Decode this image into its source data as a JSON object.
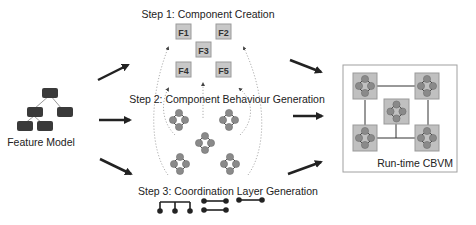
{
  "feature_model": {
    "label": "Feature Model"
  },
  "steps": [
    {
      "label": "Step 1: Component Creation"
    },
    {
      "label": "Step 2: Component Behaviour Generation"
    },
    {
      "label": "Step 3: Coordination Layer Generation"
    }
  ],
  "components": [
    {
      "id": "F1"
    },
    {
      "id": "F2"
    },
    {
      "id": "F3"
    },
    {
      "id": "F4"
    },
    {
      "id": "F5"
    }
  ],
  "output": {
    "label": "Run-time CBVM"
  },
  "colors": {
    "component_fill": "#c8c8c8",
    "component_stroke": "#9a9a9a",
    "node_fill": "#8a8a8a",
    "feature_box": "#3a3a3a",
    "arrow": "#222222",
    "dotted": "#9a9a9a",
    "frame": "#a0a0a0"
  }
}
